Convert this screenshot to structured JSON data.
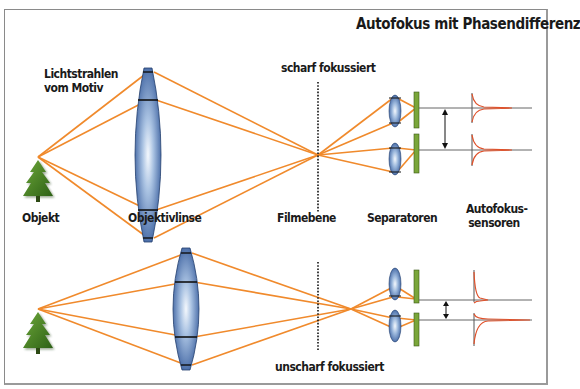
{
  "title": "Autofokus mit Phasendifferenz",
  "labels": {
    "rays": [
      "Lichtstrahlen",
      "vom Motiv"
    ],
    "focus_sharp": "scharf fokussiert",
    "focus_blurred": "unscharf fokussiert",
    "object": "Objekt",
    "lens": "Objektivlinse",
    "film_plane": "Filmebene",
    "separators": "Separatoren",
    "af_sensors": [
      "Autofokus-",
      "sensoren"
    ]
  },
  "colors": {
    "ray": "#f08a2c",
    "lens_dark": "#2f5597",
    "lens_light": "#e8f0fa",
    "plate": "#7aa63a",
    "tree": "#3e7b1f",
    "sensor_curve": "#e0512a",
    "line": "#444444",
    "frame": "#8a8a8a"
  },
  "diagrams": [
    {
      "name": "in-focus",
      "state": "scharf fokussiert"
    },
    {
      "name": "out-of-focus",
      "state": "unscharf fokussiert"
    }
  ]
}
